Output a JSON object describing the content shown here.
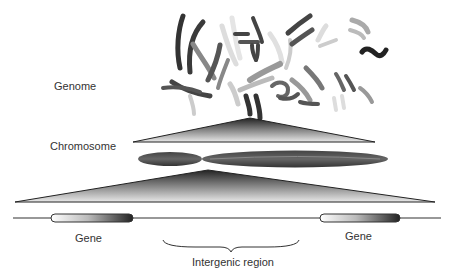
{
  "labels": {
    "genome": "Genome",
    "chromosome": "Chromosome",
    "gene_left": "Gene",
    "gene_right": "Gene",
    "intergenic": "Intergenic region"
  },
  "colors": {
    "dark": "#2a2a2a",
    "mid": "#777777",
    "light": "#d8d8d8",
    "text": "#333333"
  }
}
